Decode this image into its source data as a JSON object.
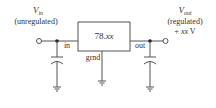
{
  "diagram": {
    "input": {
      "symbol": "V",
      "subscript": "in",
      "note": "(unregulated)"
    },
    "output": {
      "symbol": "V",
      "subscript": "out",
      "note": "(regulated)",
      "value_prefix": "+ ",
      "value_var": "xx",
      "value_unit": " V"
    },
    "regulator": {
      "label_prefix": "78.",
      "label_var": "xx",
      "pin_in": "in",
      "pin_out": "out",
      "pin_gnd": "grnd"
    },
    "colors": {
      "wire": "#555555",
      "text": "#333333",
      "background": "#ffffff"
    }
  }
}
